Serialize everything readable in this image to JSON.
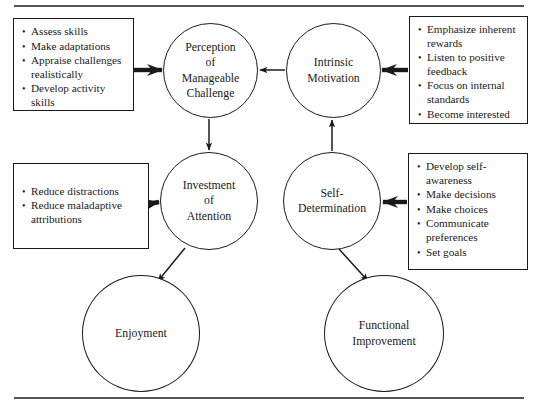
{
  "diagram": {
    "rules": {
      "top": "horizontal-rule",
      "bottom": "horizontal-rule"
    },
    "boxes": [
      {
        "id": "assess",
        "name": "box-assess-skills",
        "items": [
          "Assess skills",
          "Make adaptations",
          "Appraise challenges realistically",
          "Develop activity skills"
        ]
      },
      {
        "id": "emphasize",
        "name": "box-emphasize-rewards",
        "items": [
          "Emphasize inherent rewards",
          "Listen to positive feedback",
          "Focus on internal standards",
          "Become interested"
        ]
      },
      {
        "id": "reduce",
        "name": "box-reduce-distractions",
        "items": [
          "Reduce distractions",
          "Reduce maladaptive attributions"
        ]
      },
      {
        "id": "develop",
        "name": "box-develop-self-awareness",
        "items": [
          "Develop self-awareness",
          "Make decisions",
          "Make choices",
          "Communicate preferences",
          "Set goals"
        ]
      }
    ],
    "nodes": [
      {
        "id": "perception",
        "label": "Perception\nof\nManageable\nChallenge"
      },
      {
        "id": "intrinsic",
        "label": "Intrinsic\nMotivation"
      },
      {
        "id": "investment",
        "label": "Investment\nof\nAttention"
      },
      {
        "id": "selfdet",
        "label": "Self-\nDetermination"
      },
      {
        "id": "enjoyment",
        "label": "Enjoyment"
      },
      {
        "id": "functional",
        "label": "Functional\nImprovement"
      }
    ],
    "edges": [
      {
        "from": "box-assess",
        "to": "perception",
        "style": "thick-arrow-right"
      },
      {
        "from": "box-emphasize",
        "to": "intrinsic",
        "style": "thick-arrow-left"
      },
      {
        "from": "box-reduce",
        "to": "investment",
        "style": "thick-arrow-right"
      },
      {
        "from": "box-develop",
        "to": "selfdet",
        "style": "thick-arrow-left"
      },
      {
        "from": "intrinsic",
        "to": "perception",
        "style": "thin-arrow-left"
      },
      {
        "from": "perception",
        "to": "investment",
        "style": "thin-arrow-down"
      },
      {
        "from": "selfdet",
        "to": "intrinsic",
        "style": "thin-arrow-up"
      },
      {
        "from": "investment",
        "to": "enjoyment",
        "style": "thin-arrow-diagonal-down-left"
      },
      {
        "from": "selfdet",
        "to": "functional",
        "style": "thin-arrow-diagonal-down-right"
      }
    ],
    "colors": {
      "stroke": "#1a1a1a",
      "rule": "#555555",
      "background": "#ffffff"
    }
  }
}
